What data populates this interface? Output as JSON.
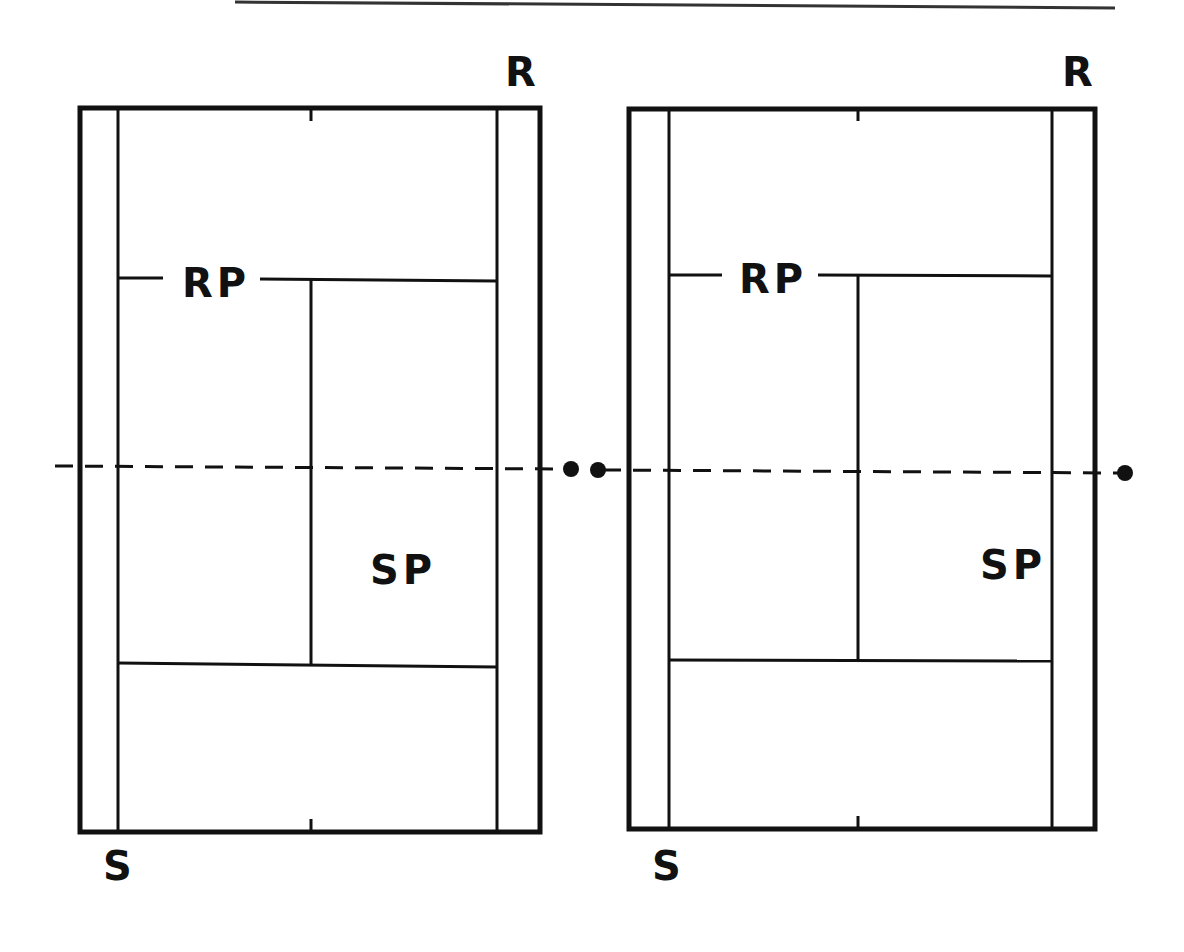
{
  "diagram": {
    "type": "tennis-court-positions",
    "colors": {
      "ink": "#111111",
      "background": "#ffffff"
    },
    "header_rule": {
      "x1": 235,
      "y1": 2,
      "x2": 1115,
      "y2": 8
    },
    "courts": [
      {
        "id": "left",
        "labels": {
          "top_right": "R",
          "bottom_left": "S",
          "upper_mid": "RP",
          "lower_mid": "SP"
        },
        "outer": {
          "x": 80,
          "y": 108,
          "w": 460,
          "h": 724
        },
        "inner_left_x": 118,
        "inner_right_x": 497,
        "center_x": 311,
        "upper_service_y": 279,
        "lower_service_y": 665
      },
      {
        "id": "right",
        "labels": {
          "top_right": "R",
          "bottom_left": "S",
          "upper_mid": "RP",
          "lower_mid": "SP"
        },
        "outer": {
          "x": 629,
          "y": 109,
          "w": 466,
          "h": 720
        },
        "inner_left_x": 669,
        "inner_right_x": 1052,
        "center_x": 858,
        "upper_service_y": 276,
        "lower_service_y": 660
      }
    ],
    "net_line": {
      "style": "dashed",
      "y_left": 466,
      "y_right": 472,
      "x_start": 55,
      "x_end": 1125
    },
    "position_markers": [
      {
        "name": "left-court-marker",
        "x": 571,
        "y": 469
      },
      {
        "name": "right-court-marker-left",
        "x": 598,
        "y": 470
      },
      {
        "name": "right-court-marker-right",
        "x": 1125,
        "y": 473
      }
    ]
  }
}
